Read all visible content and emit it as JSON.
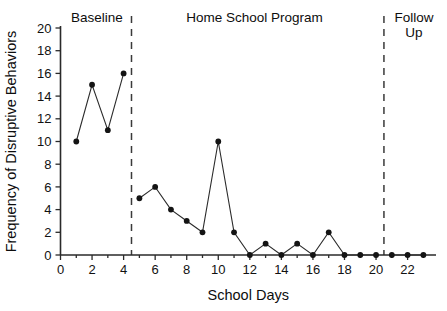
{
  "chart_data": {
    "type": "line",
    "title": "",
    "xlabel": "School Days",
    "ylabel": "Frequency of Disruptive Behaviors",
    "xlim": [
      0,
      23.8
    ],
    "ylim": [
      0,
      20
    ],
    "grid": false,
    "legend_position": "none",
    "x_ticks": [
      0,
      2,
      4,
      6,
      8,
      10,
      12,
      14,
      16,
      18,
      20,
      22
    ],
    "x_tick_labels": [
      "0",
      "2",
      "4",
      "6",
      "8",
      "10",
      "12",
      "14",
      "16",
      "18",
      "20",
      "22"
    ],
    "x_minor_ticks": [
      1,
      3,
      5,
      7,
      9,
      11,
      13,
      15,
      17,
      19,
      21,
      23
    ],
    "y_ticks": [
      0,
      2,
      4,
      6,
      8,
      10,
      12,
      14,
      16,
      18,
      20
    ],
    "y_tick_labels": [
      "0",
      "2",
      "4",
      "6",
      "8",
      "10",
      "12",
      "14",
      "16",
      "18",
      "20"
    ],
    "x": [
      1,
      2,
      3,
      4,
      5,
      6,
      7,
      8,
      9,
      10,
      11,
      12,
      13,
      14,
      15,
      16,
      17,
      18,
      19,
      20,
      21,
      22,
      23
    ],
    "values": [
      10,
      15,
      11,
      16,
      5,
      6,
      4,
      3,
      2,
      10,
      2,
      0,
      1,
      0,
      1,
      0,
      2,
      0,
      0,
      0,
      0,
      0,
      0
    ],
    "segments": [
      {
        "name": "Baseline",
        "x": [
          1,
          2,
          3,
          4
        ],
        "values": [
          10,
          15,
          11,
          16
        ]
      },
      {
        "name": "Home School Program",
        "x": [
          5,
          6,
          7,
          8,
          9,
          10,
          11,
          12,
          13,
          14,
          15,
          16,
          17,
          18,
          19,
          20
        ],
        "values": [
          5,
          6,
          4,
          3,
          2,
          10,
          2,
          0,
          1,
          0,
          1,
          0,
          2,
          0,
          0,
          0
        ]
      },
      {
        "name": "Follow Up",
        "x": [
          21,
          22,
          23
        ],
        "values": [
          0,
          0,
          0
        ]
      }
    ],
    "phase_dividers": [
      4.5,
      20.5
    ],
    "phase_labels": [
      {
        "text": "Baseline",
        "lines": [
          "Baseline"
        ],
        "x_center": 2.3
      },
      {
        "text": "Home School Program",
        "lines": [
          "Home School Program"
        ],
        "x_center": 12.3
      },
      {
        "text": "Follow Up",
        "lines": [
          "Follow",
          "Up"
        ],
        "x_center": 22.4
      }
    ]
  }
}
